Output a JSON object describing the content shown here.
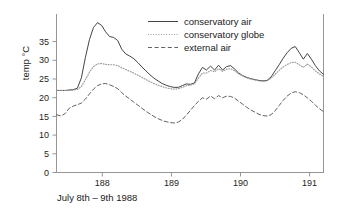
{
  "chart_data": {
    "type": "line",
    "title": "",
    "xlabel": "July 8th – 9th 1988",
    "ylabel": "temp °C",
    "xlim": [
      187.25,
      191.22
    ],
    "ylim": [
      0,
      36.5
    ],
    "xticks": [
      188,
      189,
      190,
      191
    ],
    "xticklabels": [
      "188",
      "189",
      "190",
      "191"
    ],
    "yticks": [
      0,
      5,
      10,
      15,
      20,
      25,
      30,
      35
    ],
    "yticklabels": [
      "0",
      "5",
      "10",
      "15",
      "20",
      "25",
      "30",
      "35"
    ],
    "grid": false,
    "legend_position": "top-right",
    "x": [
      187.25,
      187.32,
      187.38,
      187.44,
      187.5,
      187.56,
      187.62,
      187.68,
      187.74,
      187.8,
      187.86,
      187.92,
      187.98,
      188.04,
      188.1,
      188.16,
      188.22,
      188.28,
      188.34,
      188.4,
      188.46,
      188.52,
      188.58,
      188.64,
      188.7,
      188.76,
      188.82,
      188.88,
      188.94,
      189.0,
      189.06,
      189.12,
      189.18,
      189.24,
      189.3,
      189.36,
      189.42,
      189.48,
      189.54,
      189.6,
      189.66,
      189.72,
      189.78,
      189.84,
      189.9,
      189.96,
      190.02,
      190.08,
      190.14,
      190.2,
      190.26,
      190.32,
      190.38,
      190.44,
      190.5,
      190.56,
      190.62,
      190.68,
      190.74,
      190.8,
      190.86,
      190.92,
      190.98,
      191.04,
      191.1,
      191.16,
      191.22
    ],
    "series": [
      {
        "name": "conservatory air",
        "style": "solid",
        "color": "#3a3a3a",
        "values": [
          18.9,
          18.9,
          18.9,
          19.0,
          19.1,
          19.4,
          21.8,
          26.5,
          30.6,
          33.4,
          34.5,
          33.9,
          32.4,
          31.3,
          31.1,
          30.4,
          28.4,
          27.3,
          26.8,
          26.2,
          25.3,
          24.3,
          23.4,
          22.5,
          21.7,
          21.1,
          20.5,
          20.1,
          19.8,
          19.6,
          19.6,
          20.0,
          20.4,
          20.3,
          20.6,
          22.7,
          24.2,
          23.6,
          24.5,
          23.6,
          24.7,
          23.6,
          24.4,
          24.6,
          23.8,
          22.9,
          22.3,
          21.9,
          21.6,
          21.4,
          21.2,
          21.1,
          21.2,
          22.0,
          23.4,
          24.8,
          26.3,
          27.6,
          28.6,
          29.0,
          27.6,
          26.1,
          27.4,
          26.1,
          24.6,
          23.4,
          22.6
        ]
      },
      {
        "name": "conservatory globe",
        "style": "dotted",
        "color": "#9a9a9a",
        "values": [
          18.9,
          18.9,
          18.9,
          18.9,
          19.0,
          19.1,
          19.8,
          21.4,
          23.1,
          24.4,
          25.0,
          25.1,
          24.9,
          24.8,
          24.8,
          24.6,
          24.1,
          23.7,
          23.3,
          22.9,
          22.4,
          21.9,
          21.4,
          20.9,
          20.5,
          20.1,
          19.8,
          19.5,
          19.3,
          19.2,
          19.3,
          19.6,
          20.0,
          20.1,
          20.4,
          21.7,
          22.9,
          22.9,
          23.5,
          23.2,
          23.9,
          23.3,
          23.8,
          23.9,
          23.4,
          22.7,
          22.2,
          21.8,
          21.5,
          21.3,
          21.1,
          21.0,
          21.1,
          21.7,
          22.6,
          23.5,
          24.3,
          24.9,
          25.3,
          25.4,
          24.8,
          24.2,
          25.0,
          24.3,
          23.4,
          22.7,
          22.1
        ]
      },
      {
        "name": "external air",
        "style": "dashed",
        "color": "#5a5a5a",
        "values": [
          13.3,
          13.0,
          13.6,
          14.8,
          15.3,
          15.6,
          16.0,
          16.9,
          18.1,
          19.2,
          20.0,
          20.4,
          20.5,
          20.2,
          19.8,
          19.3,
          18.4,
          17.6,
          16.9,
          16.2,
          15.5,
          14.8,
          14.1,
          13.5,
          12.9,
          12.4,
          12.0,
          11.7,
          11.5,
          11.4,
          11.6,
          12.2,
          13.2,
          14.3,
          15.4,
          16.4,
          17.2,
          16.9,
          17.6,
          17.0,
          17.7,
          17.2,
          17.6,
          17.5,
          17.1,
          16.4,
          15.7,
          15.0,
          14.4,
          13.9,
          13.4,
          13.1,
          13.0,
          13.3,
          14.2,
          15.4,
          16.6,
          17.6,
          18.3,
          18.6,
          18.4,
          17.9,
          17.2,
          16.4,
          15.5,
          14.7,
          14.0
        ]
      }
    ]
  },
  "legend": {
    "items": [
      {
        "label": "conservatory air"
      },
      {
        "label": "conservatory globe"
      },
      {
        "label": "external air"
      }
    ]
  }
}
